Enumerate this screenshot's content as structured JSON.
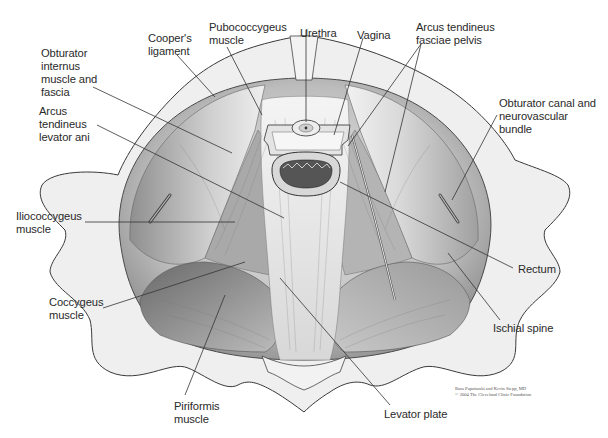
{
  "figure": {
    "labels": {
      "coopers_ligament": "Cooper's\nligament",
      "pubococcygeus": "Pubococcygeus\nmuscle",
      "urethra": "Urethra",
      "vagina": "Vagina",
      "arcus_fasciae": "Arcus tendineus\nfasciae pelvis",
      "obturator_internus": "Obturator\ninternus\nmuscle and\nfascia",
      "arcus_levator": "Arcus\ntendineus\nlevator ani",
      "obturator_canal": "Obturator canal and\nneurovascular\nbundle",
      "iliococcygeus": "Iliococcygeus\nmuscle",
      "rectum": "Rectum",
      "coccygeus": "Coccygeus\nmuscle",
      "ischial_spine": "Ischial spine",
      "piriformis": "Piriformis\nmuscle",
      "levator_plate": "Levator plate"
    },
    "credit": "Russ Papafaraki and Kevin Stepp, MD\n© 2004 The Cleveland Clinic Foundation",
    "colors": {
      "bone_fill": "#efefef",
      "bone_stroke": "#3a3a3a",
      "muscle_light": "#dcdcdc",
      "muscle_dark": "#8a8a8a",
      "leader_line": "#333333",
      "text": "#2a2a2a"
    }
  }
}
